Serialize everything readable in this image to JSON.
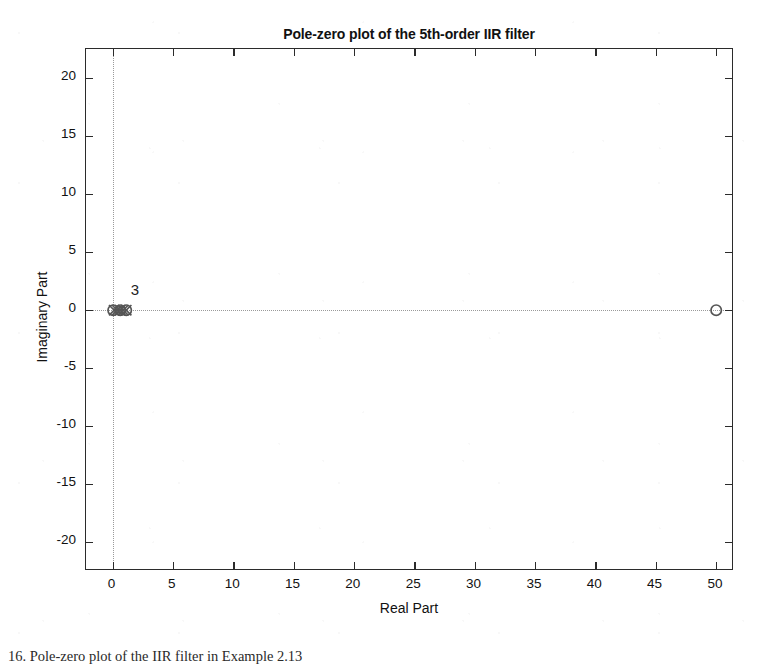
{
  "chart_data": {
    "type": "scatter",
    "title": "Pole-zero plot of the 5th-order IIR filter",
    "xlabel": "Real Part",
    "ylabel": "Imaginary Part",
    "xlim": [
      -2.2,
      51.5
    ],
    "ylim": [
      -22.5,
      22.5
    ],
    "xticks": [
      0,
      5,
      10,
      15,
      20,
      25,
      30,
      35,
      40,
      45,
      50
    ],
    "xtick_labels": [
      "0",
      "5",
      "10",
      "15",
      "20",
      "25",
      "30",
      "35",
      "40",
      "45",
      "50"
    ],
    "yticks": [
      20,
      15,
      10,
      5,
      0,
      -5,
      -10,
      -15,
      -20
    ],
    "ytick_labels": [
      "20",
      "15",
      "10",
      "5",
      "0",
      "-5",
      "-10",
      "-15",
      "-20"
    ],
    "grid": true,
    "grid_style": "dotted",
    "grid_lines": {
      "vertical_at_x": 0,
      "horizontal_at_y": 0
    },
    "legend": null,
    "marker_color": "#555555",
    "series": [
      {
        "name": "Zeros",
        "marker": "circle",
        "points": [
          {
            "x": 0.05,
            "y": 0.0
          },
          {
            "x": 0.6,
            "y": 0.0
          },
          {
            "x": 1.15,
            "y": 0.0
          },
          {
            "x": 50.0,
            "y": 0.0
          }
        ]
      },
      {
        "name": "Poles",
        "marker": "cross",
        "points": [
          {
            "x": 0.1,
            "y": 0.0
          },
          {
            "x": 0.35,
            "y": 0.0
          },
          {
            "x": 0.62,
            "y": 0.0
          },
          {
            "x": 0.88,
            "y": 0.0
          },
          {
            "x": 1.1,
            "y": 0.0
          }
        ]
      }
    ],
    "annotations": [
      {
        "text": "3",
        "x": 1.5,
        "y": 1.6,
        "note": "multiplicity label for coincident roots near origin"
      }
    ]
  },
  "caption": {
    "text": "16. Pole-zero plot of the IIR filter in Example 2.13"
  }
}
